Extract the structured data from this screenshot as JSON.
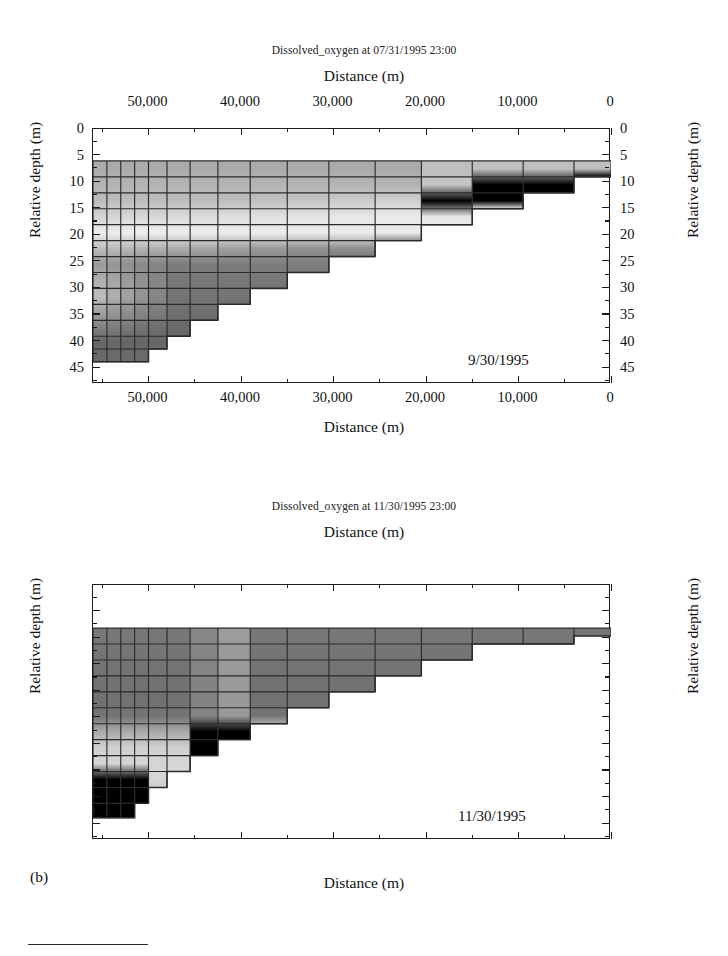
{
  "figure": {
    "panel_label": "(b)",
    "panels": [
      {
        "id": "panel-a",
        "title": "Dissolved_oxygen at 07/31/1995 23:00",
        "annotation": "9/30/1995",
        "x_axis": {
          "label_top": "Distance (m)",
          "label_bottom": "Distance (m)",
          "major_ticks": [
            50000,
            40000,
            30000,
            20000,
            10000,
            0
          ],
          "major_labels": [
            "50,000",
            "40,000",
            "30,000",
            "20,000",
            "10,000",
            "0"
          ],
          "minor_ticks": [
            55000,
            45000,
            35000,
            25000,
            15000,
            5000
          ],
          "range": [
            56000,
            0
          ],
          "direction": "reversed"
        },
        "y_axis": {
          "label_left": "Relative depth (m)",
          "label_right": "Relative depth (m)",
          "major_ticks": [
            0,
            5,
            10,
            15,
            20,
            25,
            30,
            35,
            40,
            45
          ],
          "major_labels": [
            "0",
            "5",
            "10",
            "15",
            "20",
            "25",
            "30",
            "35",
            "40",
            "45"
          ],
          "minor_ticks": [
            2.5,
            7.5,
            12.5,
            17.5,
            22.5,
            27.5,
            32.5,
            37.5,
            42.5,
            47.5
          ],
          "range": [
            0,
            48
          ],
          "units": "m"
        },
        "surface_depth_m": 6.2,
        "max_depth_m": 44.0
      },
      {
        "id": "panel-b",
        "title": "Dissolved_oxygen at 11/30/1995 23:00",
        "annotation": "11/30/1995",
        "x_axis": {
          "label_top": "Distance (m)",
          "label_bottom": "Distance (m)",
          "major_ticks": [
            50000,
            40000,
            30000,
            20000,
            10000,
            0
          ],
          "major_labels": [
            "50,000",
            "40,000",
            "30,000",
            "20,000",
            "10,000",
            "0"
          ],
          "minor_ticks": [
            55000,
            45000,
            35000,
            25000,
            15000,
            5000
          ],
          "range": [
            56000,
            0
          ],
          "direction": "reversed"
        },
        "y_axis": {
          "label_left": "Relative depth (m)",
          "label_right": "Relative depth (m)",
          "major_ticks": [
            0,
            5,
            10,
            15,
            20,
            25,
            30,
            35,
            40,
            45
          ],
          "major_labels": [
            "0",
            "5",
            "10",
            "15",
            "20",
            "25",
            "30",
            "35",
            "40",
            "45"
          ],
          "minor_ticks": [
            2.5,
            7.5,
            12.5,
            17.5,
            22.5,
            27.5,
            32.5,
            37.5,
            42.5,
            47.5
          ],
          "range": [
            0,
            48
          ],
          "units": "m"
        },
        "surface_depth_m": 8.3,
        "max_depth_m": 44.0
      }
    ]
  },
  "chart_data": [
    {
      "type": "heatmap",
      "title": "Dissolved_oxygen at 07/31/1995 23:00",
      "subtitle": "9/30/1995",
      "xlabel": "Distance (m)",
      "ylabel": "Relative depth (m)",
      "xlim": [
        56000,
        0
      ],
      "ylim": [
        0,
        48
      ],
      "grid": true,
      "colorscale": "grayscale",
      "colorscale_note": "light = high dissolved oxygen, dark = low dissolved oxygen",
      "colors": [
        "#f2f2f2",
        "#dedede",
        "#c4c4c4",
        "#ababab",
        "#949494",
        "#7d7d7d",
        "#6b6b6b"
      ],
      "x_cell_edges": [
        56000,
        54500,
        53000,
        51500,
        50000,
        48000,
        45500,
        42500,
        39000,
        35000,
        30500,
        25500,
        20500,
        15000,
        9500,
        4000,
        0
      ],
      "y_cell_edges": [
        6.2,
        9.2,
        12.2,
        15.2,
        18.2,
        21.2,
        24.2,
        27.2,
        30.2,
        33.2,
        36.2,
        39.2,
        41.6,
        44.0
      ],
      "bathymetry_bottom_m": [
        44.0,
        44.0,
        44.0,
        44.0,
        41.6,
        39.2,
        36.2,
        33.2,
        30.2,
        27.2,
        24.2,
        21.2,
        18.2,
        15.2,
        12.2,
        9.2
      ],
      "layers": [
        {
          "depth_m": 7.7,
          "value_label": "medium",
          "gray": "#ababab"
        },
        {
          "depth_m": 10.7,
          "value_label": "medium",
          "gray": "#b4b4b4"
        },
        {
          "depth_m": 13.7,
          "value_label": "medium-light",
          "gray": "#bdbdbd"
        },
        {
          "depth_m": 16.7,
          "value_label": "light",
          "gray": "#cccccc"
        },
        {
          "depth_m": 19.7,
          "value_label": "lightest",
          "gray": "#e8e8e8"
        },
        {
          "depth_m": 22.7,
          "value_label": "medium-dark",
          "gray": "#8f8f8f"
        },
        {
          "depth_m": 25.7,
          "value_label": "dark",
          "gray": "#7d7d7d"
        },
        {
          "depth_m": 28.7,
          "value_label": "dark",
          "gray": "#787878"
        },
        {
          "depth_m": 31.7,
          "value_label": "dark",
          "gray": "#747474"
        },
        {
          "depth_m": 34.7,
          "value_label": "dark",
          "gray": "#707070"
        },
        {
          "depth_m": 37.7,
          "value_label": "darkest",
          "gray": "#696969"
        },
        {
          "depth_m": 40.4,
          "value_label": "darkest",
          "gray": "#666666"
        },
        {
          "depth_m": 42.8,
          "value_label": "darkest",
          "gray": "#6b6b6b"
        }
      ],
      "features": [
        {
          "name": "oxycline",
          "description": "sharp light-to-dark transition sloping from ~20 m at 55,000 m to ~14 m at 18,000 m"
        },
        {
          "name": "deep-left-plume",
          "description": "light wedge at 25-38 m depth near 53,000-50,000 m"
        }
      ]
    },
    {
      "type": "heatmap",
      "title": "Dissolved_oxygen at 11/30/1995 23:00",
      "subtitle": "11/30/1995",
      "xlabel": "Distance (m)",
      "ylabel": "Relative depth (m)",
      "xlim": [
        56000,
        0
      ],
      "ylim": [
        0,
        48
      ],
      "grid": true,
      "colorscale": "grayscale",
      "colorscale_note": "light = high dissolved oxygen, dark = low dissolved oxygen",
      "colors": [
        "#f2f2f2",
        "#dedede",
        "#c4c4c4",
        "#ababab",
        "#949494",
        "#7d7d7d",
        "#6b6b6b"
      ],
      "x_cell_edges": [
        56000,
        54500,
        53000,
        51500,
        50000,
        48000,
        45500,
        42500,
        39000,
        35000,
        30500,
        25500,
        20500,
        15000,
        9500,
        4000,
        0
      ],
      "y_cell_edges": [
        8.3,
        11.3,
        14.3,
        17.3,
        20.3,
        23.3,
        26.3,
        29.3,
        32.3,
        35.3,
        38.3,
        41.3,
        44.0
      ],
      "bathymetry_bottom_m": [
        44.0,
        44.0,
        44.0,
        41.3,
        38.3,
        35.3,
        32.3,
        29.3,
        26.3,
        23.3,
        20.3,
        17.3,
        14.3,
        11.3,
        11.3,
        9.8
      ],
      "layers": [
        {
          "depth_m": 9.8,
          "value_label": "dark",
          "gray": "#777777"
        },
        {
          "depth_m": 12.8,
          "value_label": "dark",
          "gray": "#757575"
        },
        {
          "depth_m": 15.8,
          "value_label": "dark",
          "gray": "#737373"
        },
        {
          "depth_m": 18.8,
          "value_label": "dark",
          "gray": "#727272"
        },
        {
          "depth_m": 21.8,
          "value_label": "dark",
          "gray": "#717171"
        },
        {
          "depth_m": 24.8,
          "value_label": "dark",
          "gray": "#747474"
        },
        {
          "depth_m": 27.8,
          "value_label": "medium",
          "gray": "#9a9a9a"
        },
        {
          "depth_m": 30.8,
          "value_label": "light",
          "gray": "#c2c2c2"
        },
        {
          "depth_m": 33.8,
          "value_label": "light",
          "gray": "#c8c8c8"
        },
        {
          "depth_m": 36.8,
          "value_label": "light",
          "gray": "#cccccc"
        },
        {
          "depth_m": 39.8,
          "value_label": "medium",
          "gray": "#a8a8a8"
        },
        {
          "depth_m": 42.6,
          "value_label": "medium-dark",
          "gray": "#8a8a8a"
        }
      ],
      "features": [
        {
          "name": "vertical-light-streak",
          "description": "narrow light column near 42,500-41,000 m spanning 8-33 m depth"
        },
        {
          "name": "deep-light-layer",
          "description": "broad light zone below ~28 m depth extending from 55,000 m to ~22,000 m"
        },
        {
          "name": "bottom-left-bright-patch",
          "description": "brightest cells at 36-43 m depth near 55,000-51,000 m"
        }
      ]
    }
  ]
}
